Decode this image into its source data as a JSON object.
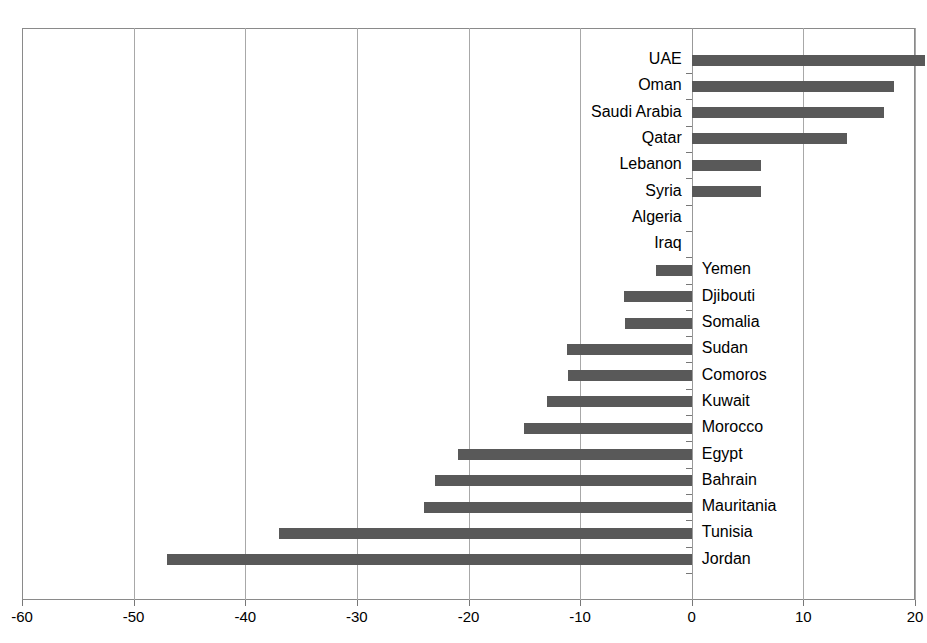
{
  "chart_title": "",
  "chart_data": {
    "type": "bar",
    "orientation": "horizontal",
    "title": "",
    "xlabel": "",
    "ylabel": "",
    "xlim": [
      -60,
      20
    ],
    "xticks": [
      -60,
      -50,
      -40,
      -30,
      -20,
      -10,
      0,
      10,
      20
    ],
    "xtick_labels": [
      "-60",
      "-50",
      "-40",
      "-30",
      "-20",
      "-10",
      "0",
      "10",
      "20"
    ],
    "grid": true,
    "legend": false,
    "bar_color": "#595959",
    "categories": [
      "UAE",
      "Oman",
      "Saudi Arabia",
      "Qatar",
      "Lebanon",
      "Syria",
      "Algeria",
      "Iraq",
      "Yemen",
      "Djibouti",
      "Somalia",
      "Sudan",
      "Comoros",
      "Kuwait",
      "Morocco",
      "Egypt",
      "Bahrain",
      "Mauritania",
      "Tunisia",
      "Jordan"
    ],
    "values": [
      20.9,
      18.1,
      17.2,
      13.9,
      6.2,
      6.2,
      0,
      0,
      -3.2,
      -6.1,
      -6.0,
      -11.2,
      -11.1,
      -13.0,
      -15.0,
      -20.9,
      -23.0,
      -24.0,
      -37.0,
      -47.0
    ]
  }
}
